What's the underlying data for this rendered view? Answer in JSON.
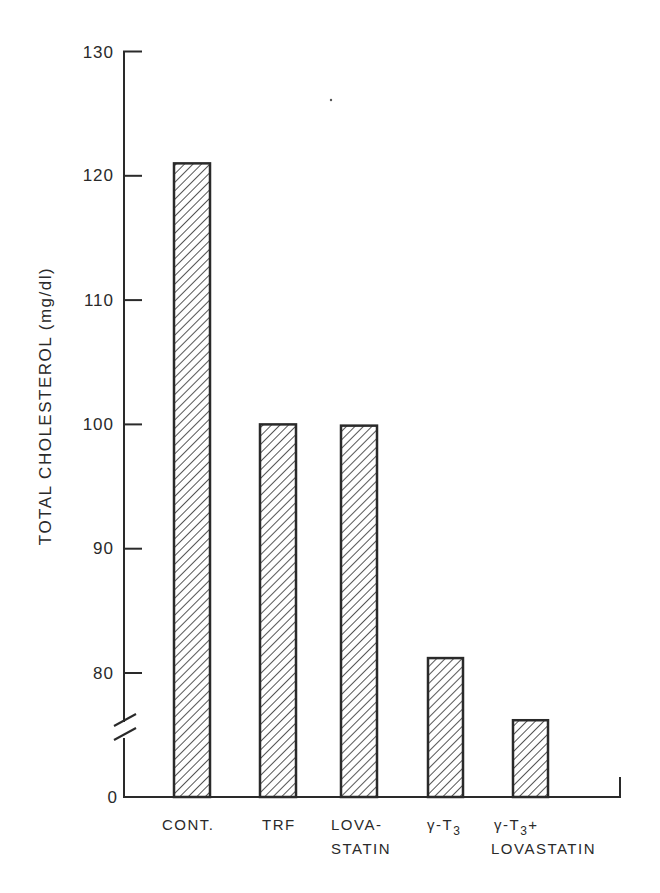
{
  "chart_data": {
    "type": "bar",
    "title": "",
    "xlabel": "",
    "ylabel": "TOTAL CHOLESTEROL (mg/dl)",
    "categories": [
      "CONT.",
      "TRF",
      "LOVASTATIN",
      "γ-T3",
      "γ-T3 + LOVASTATIN"
    ],
    "category_label_lines": [
      [
        "CONT."
      ],
      [
        "TRF"
      ],
      [
        "LOVA-",
        "STATIN"
      ],
      [
        "γ-T3"
      ],
      [
        "γ-T3+",
        "LOVASTATIN"
      ]
    ],
    "values": [
      121,
      100,
      99.9,
      81.2,
      76.2
    ],
    "ylim": [
      0,
      130
    ],
    "y_axis_break": true,
    "y_ticks": [
      0,
      80,
      90,
      100,
      110,
      120,
      130
    ],
    "grid": false,
    "legend": null,
    "bar_fill": "diagonal-hatch",
    "color": "#2a2a2a"
  },
  "axis": {
    "y_tick_labels": [
      "130",
      "120",
      "110",
      "100",
      "90",
      "80",
      "0"
    ]
  }
}
